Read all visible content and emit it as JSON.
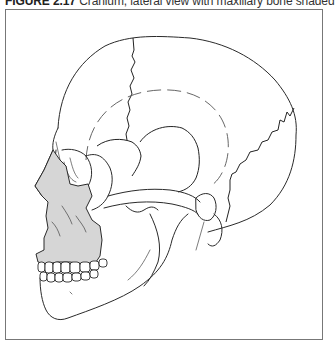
{
  "figure": {
    "label": "FIGURE 2.17",
    "caption": " Cranium, lateral view with maxillary bone shaded",
    "shaded_region": "maxillary bone",
    "shade_color": "#d6d6d6",
    "line_color": "#2a2a2a",
    "frame_color": "#777777"
  }
}
